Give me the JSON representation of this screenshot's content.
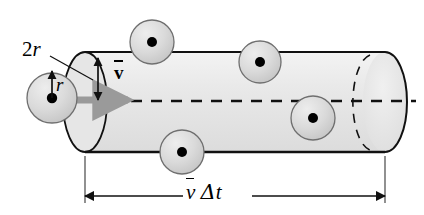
{
  "figure": {
    "labels": {
      "diameter": {
        "prefix": "2",
        "symbol": "r",
        "full": "2r"
      },
      "radius": {
        "symbol": "r",
        "full": "r"
      },
      "velocity": {
        "symbol": "v",
        "full": "v̅"
      },
      "length": {
        "symbol": "v",
        "delta": "Δ",
        "time": "t",
        "full": "v̅ Δt"
      }
    },
    "colors": {
      "outline": "#111111",
      "cylinder_fill": "#e8e8e8",
      "sphere_fill": "#d6d6d6",
      "sphere_stroke": "#6f6f6f",
      "sphere_dot": "#000000",
      "velocity_arrow": "#9a9a9a",
      "axis_dash": "#000000",
      "background": "#ffffff"
    },
    "geometry": {
      "cylinder": {
        "left_center_x": 85,
        "right_cap_x": 385,
        "hidden_cap_x": 355,
        "top_y": 52,
        "bottom_y": 152,
        "cap_rx": 22,
        "cap_ry": 50
      },
      "axis_y": 102,
      "axis_end_x": 416,
      "velocity_arrow": {
        "x1": 70,
        "x2": 130,
        "y": 100
      },
      "dimension_line": {
        "y": 196,
        "x1": 85,
        "x2": 385,
        "tick_top": 156
      },
      "spheres": [
        {
          "name": "particle-left",
          "cx": 52,
          "cy": 98,
          "r": 25
        },
        {
          "name": "particle-top",
          "cx": 152,
          "cy": 42,
          "r": 22
        },
        {
          "name": "particle-upper-right",
          "cx": 260,
          "cy": 62,
          "r": 21
        },
        {
          "name": "particle-lower-right",
          "cx": 313,
          "cy": 118,
          "r": 22
        },
        {
          "name": "particle-bottom",
          "cx": 182,
          "cy": 152,
          "r": 22
        }
      ],
      "diameter_arrow": {
        "x": 98,
        "y_top": 56,
        "y_bottom": 100
      },
      "radius_arrow": {
        "x": 52,
        "y_top": 70,
        "y_bottom": 98
      },
      "leader_line": {
        "x1": 50,
        "y1": 55,
        "x2": 88,
        "y2": 78
      }
    }
  }
}
